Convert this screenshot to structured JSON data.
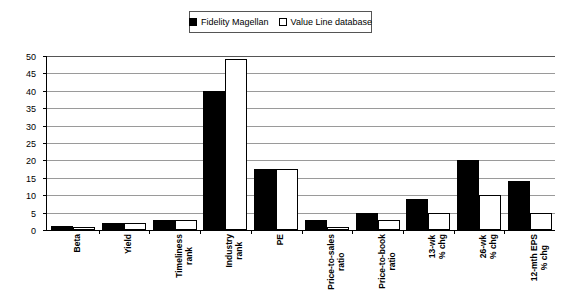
{
  "legend": {
    "entries": [
      {
        "label": "Fidelity Magellan",
        "swatch": "filled-square-icon",
        "color": "#000000"
      },
      {
        "label": "Value Line database",
        "swatch": "hollow-square-icon",
        "color": "#ffffff"
      }
    ]
  },
  "axis": {
    "y_ticks": [
      "0",
      "5",
      "10",
      "15",
      "20",
      "25",
      "30",
      "35",
      "40",
      "45",
      "50"
    ]
  },
  "chart_data": {
    "type": "bar",
    "title": "",
    "xlabel": "",
    "ylabel": "",
    "ylim": [
      0,
      50
    ],
    "ytick_step": 5,
    "grid": true,
    "legend_position": "top-center",
    "categories": [
      "Beta",
      "Yield",
      "Timeliness rank",
      "Industry rank",
      "PE",
      "Price-to-sales ratio",
      "Price-to-book ratio",
      "13-wk % chg",
      "26-wk % chg",
      "12-mth EPS % chg"
    ],
    "series": [
      {
        "name": "Fidelity Magellan",
        "color": "#000000",
        "values": [
          1.1,
          2.0,
          3.0,
          40.0,
          17.5,
          3.0,
          5.0,
          9.0,
          20.0,
          14.0
        ]
      },
      {
        "name": "Value Line database",
        "color": "#ffffff",
        "values": [
          1.0,
          2.0,
          3.0,
          49.0,
          17.5,
          1.0,
          3.0,
          5.0,
          10.0,
          5.0
        ]
      }
    ]
  }
}
